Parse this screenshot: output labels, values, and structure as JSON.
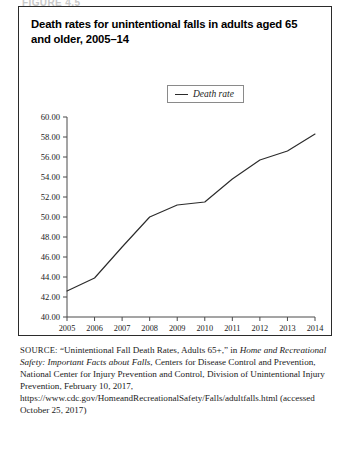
{
  "page": {
    "top_stub_text": "FIGURE 4.5"
  },
  "figure": {
    "title": "Death rates for unintentional falls in adults aged 65 and older, 2005–14",
    "legend": {
      "swatch_icon": "line-swatch-icon",
      "label": "Death rate",
      "line_color": "#2b2b2b"
    },
    "source": {
      "label": "SOURCE:",
      "part1": " “Unintentional Fall Death Rates, Adults 65+,” in ",
      "italic1": "Home and Recreational Safety: Important Facts about Falls",
      "part2": ", Centers for Disease Control and Prevention, National Center for Injury Prevention and Control, Division of Unintentional Injury Prevention, February 10, 2017, https://www.cdc.gov/HomeandRecreationalSafety/Falls/adultfalls.html (accessed October 25, 2017)"
    }
  },
  "chart_data": {
    "type": "line",
    "title": "Death rates for unintentional falls in adults aged 65 and older, 2005–14",
    "xlabel": "",
    "ylabel": "",
    "x": [
      2005,
      2006,
      2007,
      2008,
      2009,
      2010,
      2011,
      2012,
      2013,
      2014
    ],
    "categories": [
      "2005",
      "2006",
      "2007",
      "2008",
      "2009",
      "2010",
      "2011",
      "2012",
      "2013",
      "2014"
    ],
    "series": [
      {
        "name": "Death rate",
        "values": [
          42.6,
          43.9,
          47.0,
          50.0,
          51.2,
          51.5,
          53.8,
          55.7,
          56.6,
          58.3
        ],
        "color": "#2b2b2b"
      }
    ],
    "ylim": [
      40.0,
      60.0
    ],
    "ytick_step": 2.0,
    "ytick_labels": [
      "60.00",
      "58.00",
      "56.00",
      "54.00",
      "52.00",
      "50.00",
      "48.00",
      "46.00",
      "44.00",
      "42.00",
      "40.00"
    ],
    "ytick_values": [
      60.0,
      58.0,
      56.0,
      54.0,
      52.0,
      50.0,
      48.0,
      46.0,
      44.0,
      42.0,
      40.0
    ],
    "xlim": [
      2005,
      2014
    ],
    "grid": false,
    "legend_position": "top-center",
    "markers": false
  }
}
